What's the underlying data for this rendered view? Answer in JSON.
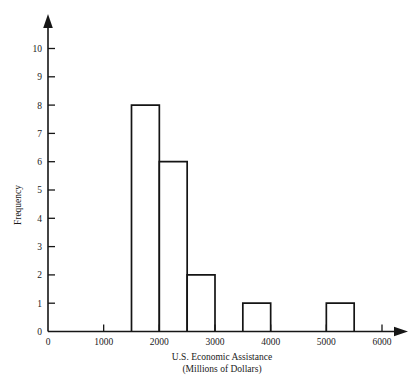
{
  "chart_data": {
    "type": "bar",
    "title": "",
    "xlabel": "U.S. Economic Assistance",
    "xlabel_line2": "(Millions of Dollars)",
    "ylabel": "Frequency",
    "xlim": [
      0,
      6000
    ],
    "ylim": [
      0,
      10
    ],
    "grid": false,
    "legend": null,
    "bin_width": 500,
    "x_ticks": [
      0,
      1000,
      2000,
      3000,
      4000,
      5000,
      6000
    ],
    "x_tick_labels": [
      "0",
      "1000",
      "2000",
      "3000",
      "4000",
      "5000",
      "6000"
    ],
    "y_ticks": [
      0,
      1,
      2,
      3,
      4,
      5,
      6,
      7,
      8,
      9,
      10
    ],
    "y_tick_labels": [
      "0",
      "1",
      "2",
      "3",
      "4",
      "5",
      "6",
      "7",
      "8",
      "9",
      "10"
    ],
    "bins": [
      {
        "start": 1500,
        "end": 2000,
        "frequency": 8
      },
      {
        "start": 2000,
        "end": 2500,
        "frequency": 6
      },
      {
        "start": 2500,
        "end": 3000,
        "frequency": 2
      },
      {
        "start": 3500,
        "end": 4000,
        "frequency": 1
      },
      {
        "start": 5000,
        "end": 5500,
        "frequency": 1
      }
    ],
    "categories": [
      "1500-2000",
      "2000-2500",
      "2500-3000",
      "3500-4000",
      "5000-5500"
    ],
    "values": [
      8,
      6,
      2,
      1,
      1
    ],
    "colors": {
      "bar_fill": "#ffffff",
      "bar_stroke": "#141414",
      "axis": "#161616",
      "text": "#1a1a1a",
      "background": "#ffffff"
    }
  }
}
